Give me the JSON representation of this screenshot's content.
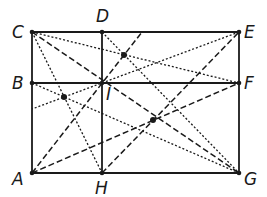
{
  "diagram": {
    "type": "geometric-construction",
    "colors": {
      "stroke": "#1a1a1a",
      "background": "#ffffff"
    },
    "points": {
      "A": [
        32,
        173
      ],
      "B": [
        32,
        83
      ],
      "C": [
        32,
        32
      ],
      "D": [
        102,
        32
      ],
      "E": [
        239,
        32
      ],
      "F": [
        239,
        83
      ],
      "G": [
        239,
        173
      ],
      "H": [
        102,
        173
      ],
      "I": [
        102,
        83
      ],
      "P1": [
        124,
        55
      ],
      "P2": [
        64,
        97
      ],
      "P3": [
        153,
        120
      ]
    },
    "labels": [
      {
        "text": "C",
        "x": 12,
        "y": 38
      },
      {
        "text": "D",
        "x": 96,
        "y": 22
      },
      {
        "text": "E",
        "x": 244,
        "y": 38
      },
      {
        "text": "B",
        "x": 12,
        "y": 89
      },
      {
        "text": "I",
        "x": 106,
        "y": 100
      },
      {
        "text": "F",
        "x": 244,
        "y": 89
      },
      {
        "text": "A",
        "x": 12,
        "y": 185
      },
      {
        "text": "H",
        "x": 95,
        "y": 194
      },
      {
        "text": "G",
        "x": 244,
        "y": 185
      }
    ],
    "solid_segments": [
      [
        "C",
        "E"
      ],
      [
        "E",
        "G"
      ],
      [
        "G",
        "A"
      ],
      [
        "A",
        "C"
      ],
      [
        "B",
        "F"
      ],
      [
        "D",
        "H"
      ]
    ],
    "dashed_segments": [
      [
        "C",
        "G"
      ],
      [
        "H",
        "E"
      ],
      [
        "A",
        "F"
      ],
      [
        "A",
        "T1"
      ]
    ],
    "dotted_segments": [
      [
        "C",
        "F"
      ],
      [
        "D",
        "G"
      ],
      [
        "B",
        "G"
      ],
      [
        "C",
        "H"
      ],
      [
        "E",
        "L1"
      ]
    ],
    "extra_points": {
      "T1": [
        142,
        32
      ],
      "L1": [
        32,
        109
      ]
    },
    "marked_points": [
      "A",
      "B",
      "C",
      "D",
      "E",
      "F",
      "G",
      "H",
      "I",
      "P1",
      "P2",
      "P3"
    ]
  }
}
